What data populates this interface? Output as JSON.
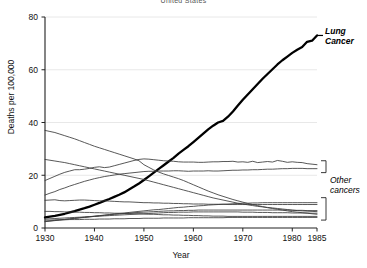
{
  "chart_data": {
    "type": "line",
    "title": "United States",
    "xlabel": "Year",
    "ylabel": "Deaths per 100,000",
    "xlim": [
      1930,
      1985
    ],
    "ylim": [
      0,
      80
    ],
    "xticks": [
      1930,
      1940,
      1950,
      1960,
      1970,
      1980,
      1985
    ],
    "yticks": [
      0,
      20,
      40,
      60,
      80
    ],
    "grid": "horizontal",
    "legend": "none",
    "annotations": [
      {
        "name": "lung-cancer-label",
        "text_line1": "Lung",
        "text_line2": "Cancer",
        "style": "bold-italic"
      },
      {
        "name": "other-cancers-label",
        "text_line1": "Other",
        "text_line2": "cancers",
        "style": "italic"
      }
    ],
    "x": [
      1930,
      1931,
      1932,
      1933,
      1934,
      1935,
      1936,
      1937,
      1938,
      1939,
      1940,
      1941,
      1942,
      1943,
      1944,
      1945,
      1946,
      1947,
      1948,
      1949,
      1950,
      1951,
      1952,
      1953,
      1954,
      1955,
      1956,
      1957,
      1958,
      1959,
      1960,
      1961,
      1962,
      1963,
      1964,
      1965,
      1966,
      1967,
      1968,
      1969,
      1970,
      1971,
      1972,
      1973,
      1974,
      1975,
      1976,
      1977,
      1978,
      1979,
      1980,
      1981,
      1982,
      1983,
      1984,
      1985
    ],
    "series": [
      {
        "name": "Lung Cancer",
        "emphasis": "bold",
        "color": "#000000",
        "values": [
          4.0,
          4.3,
          4.6,
          5.0,
          5.4,
          5.9,
          6.4,
          7.0,
          7.5,
          8.1,
          8.8,
          9.5,
          10.3,
          11.0,
          11.8,
          12.6,
          13.5,
          14.6,
          15.7,
          16.9,
          18.2,
          19.6,
          21.0,
          22.4,
          23.8,
          25.2,
          26.6,
          28.2,
          29.6,
          31.0,
          32.6,
          34.2,
          35.8,
          37.4,
          38.8,
          40.0,
          40.6,
          42.2,
          44.2,
          46.4,
          48.6,
          50.6,
          52.6,
          54.6,
          56.6,
          58.4,
          60.2,
          62.0,
          63.6,
          65.0,
          66.4,
          67.6,
          68.6,
          70.6,
          71.0,
          73.0
        ]
      },
      {
        "name": "Stomach",
        "emphasis": "normal",
        "color": "#3a3a3a",
        "values": [
          37.0,
          36.6,
          36.2,
          35.6,
          35.0,
          34.4,
          33.8,
          33.1,
          32.4,
          31.7,
          31.0,
          30.4,
          29.8,
          29.2,
          28.6,
          28.0,
          27.4,
          26.8,
          26.2,
          25.5,
          24.0,
          23.0,
          22.0,
          21.2,
          20.5,
          19.9,
          19.3,
          18.7,
          18.0,
          17.2,
          16.4,
          15.6,
          14.8,
          14.0,
          13.3,
          12.6,
          12.0,
          11.4,
          10.8,
          10.3,
          9.8,
          9.3,
          8.9,
          8.5,
          8.1,
          7.7,
          7.4,
          7.1,
          6.8,
          6.5,
          6.2,
          6.0,
          5.8,
          5.6,
          5.4,
          5.2
        ]
      },
      {
        "name": "Colon and rectum",
        "emphasis": "normal",
        "color": "#3a3a3a",
        "values": [
          18.0,
          18.8,
          19.6,
          20.4,
          21.1,
          21.6,
          22.1,
          22.1,
          22.3,
          22.6,
          23.0,
          23.2,
          22.9,
          23.1,
          23.6,
          24.1,
          24.6,
          25.1,
          25.6,
          26.0,
          26.2,
          26.1,
          25.9,
          25.7,
          25.5,
          25.4,
          25.3,
          25.1,
          25.0,
          25.0,
          25.0,
          24.9,
          24.9,
          25.0,
          25.1,
          25.1,
          25.2,
          25.2,
          25.3,
          25.0,
          25.1,
          24.9,
          25.3,
          24.8,
          25.0,
          25.2,
          25.0,
          25.6,
          25.3,
          24.9,
          25.1,
          24.9,
          24.8,
          24.4,
          24.2,
          24.0
        ]
      },
      {
        "name": "Breast",
        "emphasis": "normal",
        "color": "#3a3a3a",
        "values": [
          12.5,
          13.2,
          13.8,
          14.6,
          15.2,
          15.9,
          16.5,
          17.1,
          17.7,
          18.2,
          18.7,
          19.1,
          19.5,
          19.8,
          20.1,
          20.4,
          20.6,
          20.8,
          21.0,
          21.2,
          21.4,
          21.5,
          21.5,
          21.6,
          21.6,
          21.6,
          21.7,
          21.7,
          21.6,
          21.5,
          21.6,
          21.6,
          21.6,
          21.7,
          21.6,
          21.6,
          21.7,
          21.8,
          21.9,
          21.9,
          22.0,
          22.0,
          22.1,
          22.1,
          22.2,
          22.3,
          22.3,
          22.4,
          22.5,
          22.5,
          22.6,
          22.6,
          22.6,
          22.5,
          22.5,
          22.5
        ]
      },
      {
        "name": "Uterus",
        "emphasis": "normal",
        "color": "#3a3a3a",
        "values": [
          26.0,
          25.7,
          25.4,
          25.1,
          24.8,
          24.4,
          24.0,
          23.6,
          23.2,
          22.8,
          22.4,
          22.0,
          21.6,
          21.2,
          20.8,
          20.4,
          20.0,
          19.6,
          19.2,
          18.8,
          18.4,
          17.9,
          17.4,
          16.9,
          16.4,
          15.9,
          15.4,
          14.9,
          14.4,
          13.9,
          13.4,
          12.9,
          12.4,
          11.9,
          11.4,
          11.0,
          10.6,
          10.2,
          9.8,
          9.4,
          9.1,
          8.8,
          8.5,
          8.2,
          8.0,
          7.8,
          7.6,
          7.4,
          7.2,
          7.0,
          6.8,
          6.6,
          6.5,
          6.4,
          6.3,
          6.2
        ]
      },
      {
        "name": "Pancreas",
        "emphasis": "normal",
        "color": "#3a3a3a",
        "values": [
          2.5,
          2.7,
          2.9,
          3.1,
          3.3,
          3.5,
          3.7,
          3.9,
          4.1,
          4.3,
          4.5,
          4.7,
          4.9,
          5.1,
          5.3,
          5.5,
          5.7,
          5.9,
          6.1,
          6.3,
          6.5,
          6.7,
          6.9,
          7.0,
          7.2,
          7.4,
          7.6,
          7.8,
          7.9,
          8.1,
          8.2,
          8.4,
          8.5,
          8.7,
          8.8,
          8.9,
          9.0,
          9.1,
          9.2,
          9.3,
          9.4,
          9.4,
          9.5,
          9.5,
          9.6,
          9.6,
          9.6,
          9.6,
          9.6,
          9.6,
          9.6,
          9.6,
          9.6,
          9.6,
          9.6,
          9.6
        ]
      },
      {
        "name": "Prostate",
        "emphasis": "normal",
        "color": "#3a3a3a",
        "values": [
          10.5,
          10.6,
          10.7,
          10.4,
          10.3,
          10.4,
          10.5,
          10.6,
          10.6,
          10.5,
          10.4,
          10.3,
          10.3,
          10.2,
          10.1,
          10.0,
          9.9,
          9.9,
          9.8,
          9.7,
          9.6,
          9.6,
          9.5,
          9.5,
          9.4,
          9.4,
          9.3,
          9.3,
          9.2,
          9.2,
          9.1,
          9.1,
          9.1,
          9.0,
          9.0,
          9.0,
          9.0,
          8.9,
          8.9,
          8.9,
          8.9,
          8.9,
          8.9,
          8.9,
          8.9,
          8.9,
          8.9,
          8.9,
          8.9,
          8.9,
          8.9,
          8.9,
          8.9,
          8.9,
          8.9,
          8.9
        ]
      },
      {
        "name": "Liver",
        "emphasis": "normal",
        "color": "#3a3a3a",
        "values": [
          6.3,
          6.3,
          6.2,
          6.2,
          6.1,
          6.1,
          6.0,
          6.0,
          5.9,
          5.9,
          5.8,
          5.8,
          5.7,
          5.7,
          5.6,
          5.6,
          5.5,
          5.5,
          5.4,
          5.4,
          5.3,
          5.2,
          5.2,
          5.1,
          5.0,
          5.0,
          4.9,
          4.9,
          4.8,
          4.8,
          4.7,
          4.7,
          4.6,
          4.6,
          4.5,
          4.5,
          4.5,
          4.4,
          4.4,
          4.4,
          4.4,
          4.4,
          4.4,
          4.4,
          4.4,
          4.4,
          4.4,
          4.4,
          4.4,
          4.4,
          4.4,
          4.4,
          4.4,
          4.4,
          4.4,
          4.4
        ]
      },
      {
        "name": "Leukemia",
        "emphasis": "normal",
        "color": "#3a3a3a",
        "values": [
          2.4,
          2.6,
          2.8,
          3.0,
          3.2,
          3.4,
          3.6,
          3.8,
          4.0,
          4.2,
          4.4,
          4.6,
          4.8,
          5.0,
          5.2,
          5.3,
          5.5,
          5.6,
          5.8,
          5.9,
          6.0,
          6.1,
          6.2,
          6.3,
          6.4,
          6.5,
          6.5,
          6.6,
          6.6,
          6.7,
          6.7,
          6.8,
          6.8,
          6.8,
          6.8,
          6.8,
          6.8,
          6.8,
          6.8,
          6.8,
          6.8,
          6.8,
          6.8,
          6.8,
          6.8,
          6.8,
          6.8,
          6.8,
          6.8,
          6.8,
          6.7,
          6.7,
          6.7,
          6.6,
          6.6,
          6.6
        ]
      },
      {
        "name": "Ovary",
        "emphasis": "normal",
        "color": "#3a3a3a",
        "values": [
          3.4,
          3.5,
          3.6,
          3.7,
          3.8,
          3.9,
          4.0,
          4.1,
          4.2,
          4.3,
          4.4,
          4.5,
          4.6,
          4.7,
          4.8,
          4.9,
          5.0,
          5.1,
          5.2,
          5.3,
          5.4,
          5.5,
          5.6,
          5.7,
          5.8,
          5.9,
          5.9,
          6.0,
          6.0,
          6.0,
          6.1,
          6.1,
          6.1,
          6.1,
          6.1,
          6.1,
          6.1,
          6.1,
          6.1,
          6.1,
          6.0,
          6.0,
          6.0,
          5.9,
          5.9,
          5.9,
          5.8,
          5.8,
          5.8,
          5.8,
          5.7,
          5.7,
          5.7,
          5.7,
          5.6,
          5.6
        ]
      },
      {
        "name": "Esophagus",
        "emphasis": "normal",
        "color": "#3a3a3a",
        "values": [
          3.0,
          3.0,
          3.1,
          3.1,
          3.1,
          3.2,
          3.2,
          3.2,
          3.3,
          3.3,
          3.3,
          3.4,
          3.4,
          3.4,
          3.5,
          3.5,
          3.5,
          3.6,
          3.6,
          3.6,
          3.7,
          3.7,
          3.7,
          3.7,
          3.8,
          3.8,
          3.8,
          3.8,
          3.8,
          3.9,
          3.9,
          3.9,
          3.9,
          3.9,
          3.9,
          3.9,
          3.9,
          4.0,
          4.0,
          4.0,
          4.0,
          4.0,
          4.0,
          4.0,
          4.0,
          4.0,
          4.0,
          4.0,
          4.0,
          4.0,
          4.0,
          4.0,
          4.0,
          4.0,
          4.0,
          4.0
        ]
      }
    ]
  }
}
